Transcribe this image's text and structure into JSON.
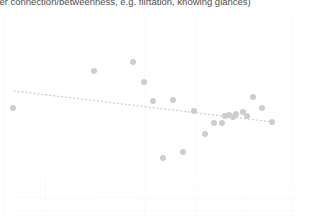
{
  "caption": {
    "text": "cter connection/betweenness, e.g. flirtation, knowing glances)",
    "color": "#4d4d4d",
    "clipped": "true"
  },
  "colors": {
    "background": "#ffffff",
    "point": "#cdcdcd",
    "trendline": "#d2d2d2",
    "gridline": "#fbfbfb",
    "caption_text": "#4d4d4d"
  },
  "chart_data": {
    "type": "scatter",
    "title": "",
    "subtitle": "",
    "xlabel": "",
    "ylabel": "",
    "xlim": [
      0,
      313
    ],
    "ylim": [
      216,
      0
    ],
    "grid": "faint-vertical-and-horizontal",
    "legend": "none",
    "tick_labels": {
      "x": [],
      "y": []
    },
    "annotations": [],
    "marker": {
      "shape": "circle",
      "size_px": 6,
      "color": "#cdcdcd",
      "opacity": 1
    },
    "series": [
      {
        "name": "observations",
        "n_points": 21,
        "points": [
          {
            "x": 13,
            "y": 108
          },
          {
            "x": 94,
            "y": 71
          },
          {
            "x": 133,
            "y": 62
          },
          {
            "x": 144,
            "y": 82
          },
          {
            "x": 153,
            "y": 101
          },
          {
            "x": 173,
            "y": 100
          },
          {
            "x": 194,
            "y": 111
          },
          {
            "x": 205,
            "y": 134
          },
          {
            "x": 214,
            "y": 123
          },
          {
            "x": 222,
            "y": 123
          },
          {
            "x": 225,
            "y": 116
          },
          {
            "x": 233,
            "y": 117
          },
          {
            "x": 236,
            "y": 114
          },
          {
            "x": 243,
            "y": 112
          },
          {
            "x": 253,
            "y": 97
          },
          {
            "x": 262,
            "y": 108
          },
          {
            "x": 272,
            "y": 122
          },
          {
            "x": 163,
            "y": 158
          },
          {
            "x": 183,
            "y": 152
          },
          {
            "x": 247,
            "y": 116
          },
          {
            "x": 229,
            "y": 115
          }
        ]
      }
    ],
    "trendline": {
      "type": "linear-fit",
      "style": "dotted",
      "color": "#d2d2d2",
      "width_px": 1.4,
      "dash_pattern": "1 3",
      "x0": 14,
      "y0": 91,
      "x1": 273,
      "y1": 122,
      "direction": "negative"
    }
  },
  "gridlines": {
    "vertical_x": [
      3,
      45,
      144,
      196,
      245,
      292
    ],
    "horizontal_y": [
      190,
      205
    ]
  },
  "ghost_artifacts": {
    "boxes": [
      {
        "x": 40,
        "y": 178,
        "w": 56,
        "h": 20
      },
      {
        "x": 140,
        "y": 178,
        "w": 52,
        "h": 20
      },
      {
        "x": 196,
        "y": 178,
        "w": 48,
        "h": 20
      },
      {
        "x": 245,
        "y": 178,
        "w": 48,
        "h": 20
      }
    ],
    "rules": [
      {
        "x": 10,
        "y": 197,
        "w": 290
      },
      {
        "x": 10,
        "y": 210,
        "w": 290
      }
    ]
  }
}
